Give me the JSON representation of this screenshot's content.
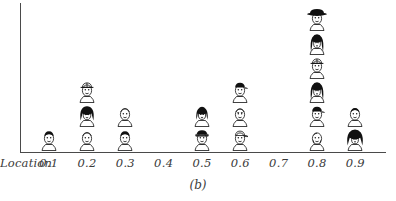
{
  "caption": "(b)",
  "axis": {
    "name_label": "Location",
    "tick_labels": [
      "0.1",
      "0.2",
      "0.3",
      "0.4",
      "0.5",
      "0.6",
      "0.7",
      "0.8",
      "0.9"
    ],
    "line_color": "#4a4a4a"
  },
  "colors": {
    "ink": "#111111",
    "axis": "#4a4a4a",
    "text": "#3a3a3a",
    "background": "#ffffff"
  },
  "chart_data": {
    "type": "bar",
    "subtype": "pictogram-histogram",
    "title": "",
    "subtitle": "",
    "xlabel": "Location",
    "ylabel": "",
    "categories": [
      "0.1",
      "0.2",
      "0.3",
      "0.4",
      "0.5",
      "0.6",
      "0.7",
      "0.8",
      "0.9"
    ],
    "values": [
      1,
      3,
      2,
      0,
      2,
      3,
      0,
      6,
      2
    ],
    "unit": "one face icon = 1 count",
    "xlim": [
      0.05,
      0.95
    ],
    "ylim": [
      0,
      6
    ],
    "grid": false,
    "legend": null,
    "annotations": [
      "(b)"
    ],
    "icons": {
      "0.1": [
        "dark-hair-face"
      ],
      "0.2": [
        "light-face",
        "dark-hair-woman-face",
        "hardhat-face"
      ],
      "0.3": [
        "dark-hair-face",
        "light-face"
      ],
      "0.4": [],
      "0.5": [
        "officer-cap-face",
        "bob-hair-woman-face"
      ],
      "0.6": [
        "light-cap-face",
        "plain-face",
        "dark-cap-face"
      ],
      "0.7": [],
      "0.8": [
        "bald-light-face",
        "dark-cap-face",
        "long-hair-woman-face",
        "hardhat-face",
        "long-hair-woman-face",
        "cowboy-hat-face"
      ],
      "0.9": [
        "black-bouffant-hair-face",
        "short-hair-face"
      ]
    }
  }
}
